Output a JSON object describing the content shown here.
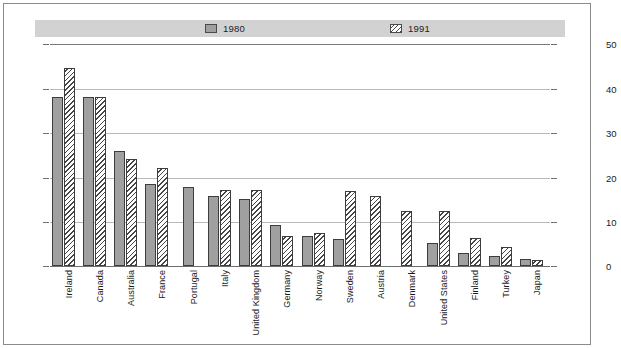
{
  "legend": {
    "items": [
      {
        "label": "1980",
        "style": "solid-gray",
        "color": "#a0a0a0"
      },
      {
        "label": "1991",
        "style": "diagonal-hatch",
        "color": "#454545"
      }
    ]
  },
  "axis": {
    "left_ticks": [
      "50",
      "40",
      "30",
      "20",
      "10",
      "0"
    ],
    "right_ticks": [
      "50",
      "40",
      "30",
      "20",
      "10",
      "0"
    ]
  },
  "chart_data": {
    "type": "bar",
    "title": "",
    "subtitle": "",
    "xlabel": "",
    "ylabel": "",
    "ylim": [
      0,
      50
    ],
    "ytick_step": 10,
    "grid": true,
    "legend_position": "top",
    "categories": [
      "Ireland",
      "Canada",
      "Australia",
      "France",
      "Portugal",
      "Italy",
      "United Kingdom",
      "Germany",
      "Norway",
      "Sweden",
      "Austria",
      "Denmark",
      "United States",
      "Finland",
      "Turkey",
      "Japan"
    ],
    "series": [
      {
        "name": "1980",
        "values": [
          38,
          38,
          26,
          18.5,
          17.7,
          15.8,
          15,
          9.2,
          6.8,
          6.1,
          null,
          null,
          5.2,
          3,
          2.3,
          1.5
        ]
      },
      {
        "name": "1991",
        "values": [
          44.5,
          38,
          24,
          22,
          null,
          17.2,
          17.2,
          6.8,
          7.4,
          17,
          15.8,
          12.5,
          12.5,
          6.2,
          4.3,
          1.3
        ]
      }
    ]
  }
}
